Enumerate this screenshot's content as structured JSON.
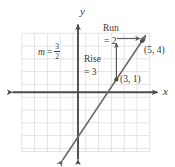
{
  "figure": {
    "title": "",
    "axis_labels": {
      "x": "x",
      "y": "y"
    },
    "slope_label": {
      "variable": "m",
      "equals": "=",
      "numerator": "3",
      "denominator": "2"
    },
    "rise": {
      "word": "Rise",
      "value": "= 3"
    },
    "run": {
      "word": "Run",
      "value": "= 2"
    },
    "points": [
      {
        "name": "point-3-1",
        "label": "(3, 1)",
        "x": 3,
        "y": 1
      },
      {
        "name": "point-5-4",
        "label": "(5, 4)",
        "x": 5,
        "y": 4
      }
    ],
    "colors": {
      "grid": "#d9d9dd",
      "axis": "#4a4a4a",
      "line": "#6b6b6b",
      "text": "#3a3a3a",
      "background": "#ffffff"
    }
  },
  "chart_data": {
    "type": "line",
    "title": "",
    "xlabel": "x",
    "ylabel": "y",
    "grid": true,
    "legend": "none",
    "xlim": [
      -4.4,
      5.6
    ],
    "ylim": [
      -4.6,
      4.7
    ],
    "tick_step": 1,
    "series": [
      {
        "name": "slope-line",
        "equation": "y = (3/2)x - 7/2",
        "slope": 1.5,
        "intercept": -3.5,
        "x": [
          -1.2,
          5.3
        ],
        "y": [
          -5.3,
          4.45
        ],
        "arrow_start": true,
        "arrow_end": true
      }
    ],
    "points": [
      {
        "x": 3,
        "y": 1,
        "label": "(3, 1)"
      },
      {
        "x": 5,
        "y": 4,
        "label": "(5, 4)"
      }
    ],
    "annotations": [
      {
        "text": "m = 3/2",
        "x": -2.6,
        "y": 2.4,
        "name": "slope-annotation"
      },
      {
        "text": "Rise = 3",
        "x": 1.55,
        "y": 2.3,
        "name": "rise-annotation"
      },
      {
        "text": "Run = 2",
        "x": 4.0,
        "y": 4.9,
        "name": "run-annotation"
      }
    ],
    "vectors": [
      {
        "name": "rise-arrow",
        "from": [
          3,
          1
        ],
        "to": [
          3,
          4
        ],
        "direction": "up",
        "magnitude": 3
      },
      {
        "name": "run-arrow",
        "from": [
          3,
          4
        ],
        "to": [
          5,
          4
        ],
        "direction": "right",
        "magnitude": 2
      }
    ]
  }
}
